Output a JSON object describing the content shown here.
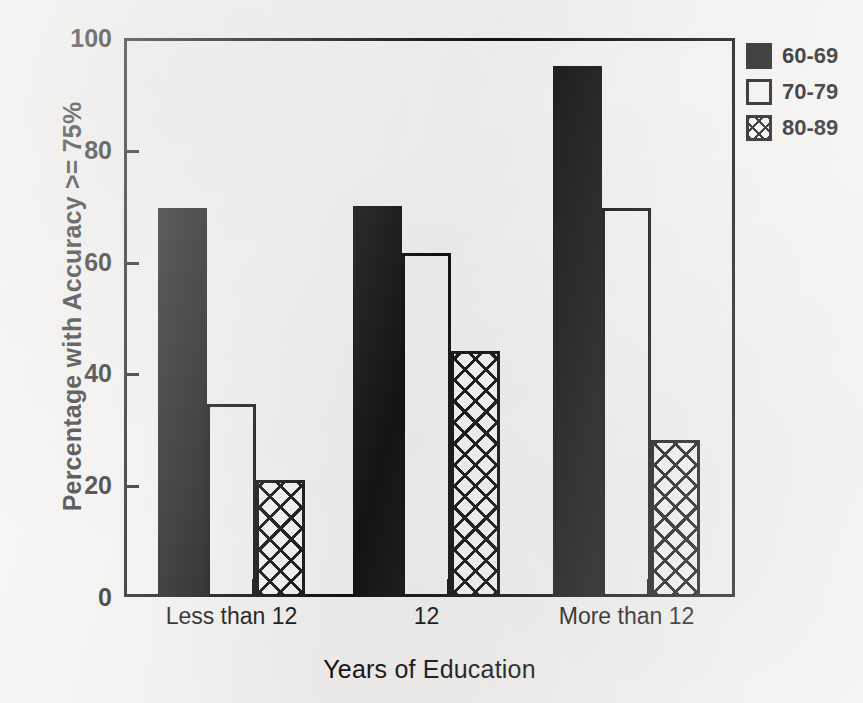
{
  "chart_data": {
    "type": "bar",
    "title": "",
    "subtitle": "",
    "xlabel": "Years of Education",
    "ylabel": "Percentage with Accuracy >= 75%",
    "categories": [
      "Less than 12",
      "12",
      "More than 12"
    ],
    "series": [
      {
        "name": "60-69",
        "values": [
          69.5,
          70,
          95
        ],
        "fill": "solid-black"
      },
      {
        "name": "70-79",
        "values": [
          34.5,
          61.5,
          69.5
        ],
        "fill": "open-white"
      },
      {
        "name": "80-89",
        "values": [
          21,
          44,
          28
        ],
        "fill": "cross-hatch"
      }
    ],
    "ylim": [
      0,
      100
    ],
    "yticks": [
      0,
      20,
      40,
      60,
      80,
      100
    ],
    "ytick_labels": [
      "0",
      "20",
      "40",
      "60",
      "80",
      "100"
    ],
    "grid": false,
    "legend_position": "top-right-outside",
    "legend_entries": [
      "60-69",
      "70-79",
      "80-89"
    ],
    "annotations": []
  },
  "colors": {
    "ink": "#111111",
    "bar_solid": "#141414",
    "paper": "#f4f3f1",
    "bar_open_fill": "#ffffff"
  }
}
